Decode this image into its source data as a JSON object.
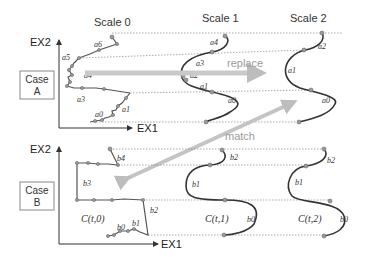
{
  "scales": [
    {
      "label": "Scale 0"
    },
    {
      "label": "Scale 1"
    },
    {
      "label": "Scale 2"
    }
  ],
  "axes": {
    "y_label": "EX2",
    "x_label": "EX1"
  },
  "cases": [
    {
      "label_line1": "Case",
      "label_line2": "A"
    },
    {
      "label_line1": "Case",
      "label_line2": "B"
    }
  ],
  "arrows": {
    "replace": "replace",
    "match": "match"
  },
  "case_a_labels": {
    "scale0": [
      "a6",
      "a5",
      "a4",
      "a3",
      "a2",
      "a1",
      "a0"
    ],
    "scale0_sup": "0",
    "scale1": [
      "a4",
      "a3",
      "a2",
      "a1",
      "a0"
    ],
    "scale1_sup": "1",
    "scale2": [
      "a2",
      "a1",
      "a0"
    ],
    "scale2_sup": "2"
  },
  "case_b_labels": {
    "scale0": [
      "b4",
      "b3",
      "b2",
      "b1",
      "b0"
    ],
    "scale0_sup": "0",
    "scale1": [
      "b2",
      "b1",
      "b0"
    ],
    "scale1_sup": "1",
    "scale2": [
      "b2",
      "b1",
      "b0"
    ],
    "scale2_sup": "2"
  },
  "curve_labels": {
    "c0": "C(t,0)",
    "c1": "C(t,1)",
    "c2": "C(t,2)"
  },
  "colors": {
    "curve": "#333333",
    "arrow": "#bdbdbd",
    "guide": "#888888"
  }
}
